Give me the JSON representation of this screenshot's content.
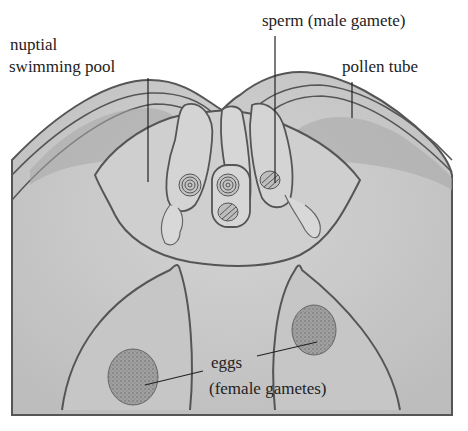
{
  "diagram": {
    "labels": {
      "nuptial_line1": "nuptial",
      "nuptial_line2": "swimming pool",
      "sperm": "sperm (male gamete)",
      "pollen_tube": "pollen tube",
      "eggs_line1": "eggs",
      "eggs_line2": "(female gametes)"
    },
    "colors": {
      "tissue": "#c9c9c9",
      "tissue_dark": "#b3b3b3",
      "outline": "#555555",
      "egg": "#9a9a9a",
      "background": "#ffffff"
    }
  }
}
